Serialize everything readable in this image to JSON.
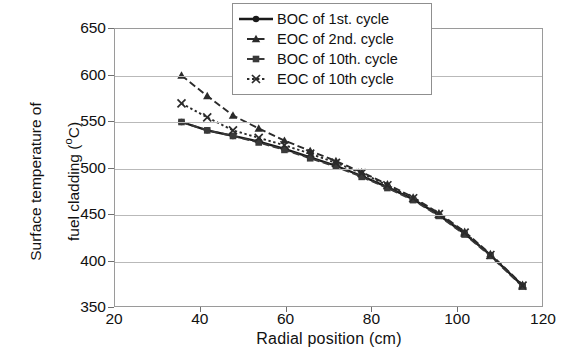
{
  "chart_data": {
    "type": "line",
    "title": "",
    "xlabel": "Radial position  (cm)",
    "ylabel": "Surface temperature of\nfuel cladding (°C)",
    "ylabel_line1": "Surface temperature of",
    "ylabel_line2_pre": "fuel cladding (",
    "ylabel_line2_sup": "o",
    "ylabel_line2_post": "C)",
    "xlim": [
      20,
      120
    ],
    "ylim": [
      350,
      650
    ],
    "xticks": [
      20,
      40,
      60,
      80,
      100,
      120
    ],
    "yticks": [
      350,
      400,
      450,
      500,
      550,
      600,
      650
    ],
    "xtick_labels": [
      "20",
      "40",
      "60",
      "80",
      "100",
      "120"
    ],
    "ytick_labels": [
      "350",
      "400",
      "450",
      "500",
      "550",
      "600",
      "650"
    ],
    "grid": "horizontal",
    "legend_position": "upper right",
    "series": [
      {
        "name": "BOC of 1st. cycle",
        "marker": "circle",
        "linestyle": "solid",
        "color": "#1a1a1a",
        "x": [
          35.5,
          41.5,
          47.5,
          53.5,
          59.5,
          65.5,
          71.5,
          77.5,
          83.5,
          89.5,
          95.5,
          101.5,
          107.5,
          115.0
        ],
        "y": [
          550,
          541,
          535,
          529,
          521,
          512,
          503,
          492,
          480,
          467,
          450,
          430,
          407,
          374
        ]
      },
      {
        "name": "EOC of 2nd. cycle",
        "marker": "triangle",
        "linestyle": "dashed",
        "color": "#2b2b2b",
        "x": [
          35.5,
          41.5,
          47.5,
          53.5,
          59.5,
          65.5,
          71.5,
          77.5,
          83.5,
          89.5,
          95.5,
          101.5,
          107.5,
          115.0
        ],
        "y": [
          600,
          578,
          557,
          543,
          530,
          519,
          508,
          496,
          483,
          469,
          452,
          432,
          408,
          375
        ]
      },
      {
        "name": "BOC of 10th. cycle",
        "marker": "square",
        "linestyle": "dashed",
        "color": "#3a3a3a",
        "x": [
          35.5,
          41.5,
          47.5,
          53.5,
          59.5,
          65.5,
          71.5,
          77.5,
          83.5,
          89.5,
          95.5,
          101.5,
          107.5,
          115.0
        ],
        "y": [
          550,
          541,
          535,
          528,
          520,
          511,
          502,
          491,
          479,
          466,
          449,
          429,
          406,
          373
        ]
      },
      {
        "name": "EOC of 10th cycle",
        "marker": "cross",
        "linestyle": "dotted",
        "color": "#2b2b2b",
        "x": [
          35.5,
          41.5,
          47.5,
          53.5,
          59.5,
          65.5,
          71.5,
          77.5,
          83.5,
          89.5,
          95.5,
          101.5,
          107.5,
          115.0
        ],
        "y": [
          570,
          555,
          541,
          533,
          525,
          516,
          506,
          495,
          482,
          468,
          451,
          431,
          407,
          374
        ]
      }
    ]
  },
  "legend": {
    "items": [
      {
        "label": "BOC of 1st. cycle"
      },
      {
        "label": "EOC of 2nd. cycle"
      },
      {
        "label": "BOC of 10th. cycle"
      },
      {
        "label": "EOC of 10th cycle"
      }
    ]
  }
}
